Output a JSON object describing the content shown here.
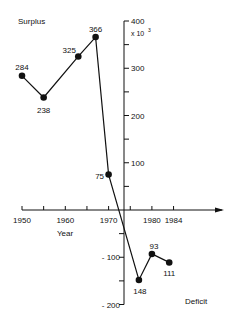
{
  "chart_data": {
    "type": "line",
    "title": "",
    "xlabel": "Year",
    "ylabel_top": "Surplus",
    "ylabel_bottom": "Deficit",
    "y_multiplier": "x 10",
    "y_multiplier_exp": "3",
    "x_ticks": [
      1950,
      1960,
      1970,
      1980,
      1984
    ],
    "y_ticks": [
      400,
      300,
      200,
      100,
      -100,
      -200
    ],
    "y_tick_labels": [
      "400",
      "300",
      "200",
      "100",
      "- 100",
      "- 200"
    ],
    "xlim": [
      1950,
      1988
    ],
    "ylim": [
      -200,
      400
    ],
    "series": [
      {
        "name": "Surplus/Deficit",
        "points": [
          {
            "x": 1950,
            "y": 284,
            "label": "284"
          },
          {
            "x": 1955,
            "y": 238,
            "label": "238"
          },
          {
            "x": 1963,
            "y": 325,
            "label": "325"
          },
          {
            "x": 1967,
            "y": 366,
            "label": "366"
          },
          {
            "x": 1970,
            "y": 75,
            "label": "75"
          },
          {
            "x": 1977,
            "y": -148,
            "label": "148"
          },
          {
            "x": 1980,
            "y": -93,
            "label": "93"
          },
          {
            "x": 1984,
            "y": -111,
            "label": "111"
          }
        ]
      }
    ],
    "grid": false
  }
}
